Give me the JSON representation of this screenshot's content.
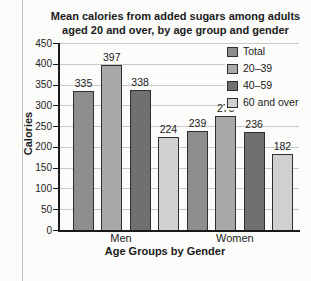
{
  "chart_data": {
    "type": "bar",
    "title_line1": "Mean calories from added sugars among adults",
    "title_line2": "aged 20 and over, by age group and gender",
    "ylabel": "Calories",
    "xlabel": "Age Groups by Gender",
    "ylim": [
      0,
      450
    ],
    "ytick_step": 50,
    "grid": true,
    "legend_position": "top-right",
    "categories": [
      "Men",
      "Women"
    ],
    "series": [
      {
        "name": "Total",
        "color": "#8e8e8e",
        "values": [
          335,
          239
        ]
      },
      {
        "name": "20–39",
        "color": "#a9a9a9",
        "values": [
          397,
          275
        ]
      },
      {
        "name": "40–59",
        "color": "#707070",
        "values": [
          338,
          236
        ]
      },
      {
        "name": "60 and over",
        "color": "#d0d0d0",
        "values": [
          224,
          182
        ]
      }
    ]
  }
}
